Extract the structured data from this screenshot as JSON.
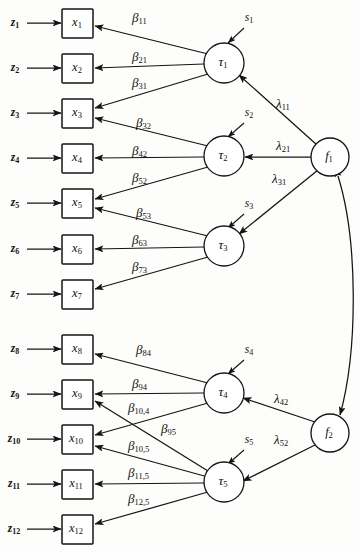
{
  "diagram": {
    "type": "structural-equation-path-diagram",
    "title": "",
    "canvas": {
      "width": 360,
      "height": 553
    },
    "colors": {
      "stroke": "#141414",
      "fill": "#ffffff",
      "background": "#fdfdfb"
    }
  },
  "observed_variables": [
    {
      "id": "x1",
      "label": "x",
      "sub": "1",
      "x": 77,
      "y": 23
    },
    {
      "id": "x2",
      "label": "x",
      "sub": "2",
      "x": 77,
      "y": 68
    },
    {
      "id": "x3",
      "label": "x",
      "sub": "3",
      "x": 77,
      "y": 113
    },
    {
      "id": "x4",
      "label": "x",
      "sub": "4",
      "x": 77,
      "y": 158
    },
    {
      "id": "x5",
      "label": "x",
      "sub": "5",
      "x": 77,
      "y": 203
    },
    {
      "id": "x6",
      "label": "x",
      "sub": "6",
      "x": 77,
      "y": 249
    },
    {
      "id": "x7",
      "label": "x",
      "sub": "7",
      "x": 77,
      "y": 294
    },
    {
      "id": "x8",
      "label": "x",
      "sub": "8",
      "x": 77,
      "y": 349
    },
    {
      "id": "x9",
      "label": "x",
      "sub": "9",
      "x": 77,
      "y": 394
    },
    {
      "id": "x10",
      "label": "x",
      "sub": "10",
      "x": 77,
      "y": 439
    },
    {
      "id": "x11",
      "label": "x",
      "sub": "11",
      "x": 77,
      "y": 484
    },
    {
      "id": "x12",
      "label": "x",
      "sub": "12",
      "x": 77,
      "y": 529
    }
  ],
  "error_variables": [
    {
      "id": "z1",
      "label": "z",
      "sub": "1",
      "x": 16,
      "y": 23
    },
    {
      "id": "z2",
      "label": "z",
      "sub": "2",
      "x": 16,
      "y": 68
    },
    {
      "id": "z3",
      "label": "z",
      "sub": "3",
      "x": 16,
      "y": 113
    },
    {
      "id": "z4",
      "label": "z",
      "sub": "4",
      "x": 16,
      "y": 158
    },
    {
      "id": "z5",
      "label": "z",
      "sub": "5",
      "x": 16,
      "y": 203
    },
    {
      "id": "z6",
      "label": "z",
      "sub": "6",
      "x": 16,
      "y": 249
    },
    {
      "id": "z7",
      "label": "z",
      "sub": "7",
      "x": 16,
      "y": 294
    },
    {
      "id": "z8",
      "label": "z",
      "sub": "8",
      "x": 16,
      "y": 349
    },
    {
      "id": "z9",
      "label": "z",
      "sub": "9",
      "x": 16,
      "y": 394
    },
    {
      "id": "z10",
      "label": "z",
      "sub": "10",
      "x": 16,
      "y": 439
    },
    {
      "id": "z11",
      "label": "z",
      "sub": "11",
      "x": 16,
      "y": 484
    },
    {
      "id": "z12",
      "label": "z",
      "sub": "12",
      "x": 16,
      "y": 529
    }
  ],
  "latent_tau": [
    {
      "id": "tau1",
      "label": "τ",
      "sub": "1",
      "x": 224,
      "y": 63,
      "r": 20
    },
    {
      "id": "tau2",
      "label": "τ",
      "sub": "2",
      "x": 224,
      "y": 156,
      "r": 20
    },
    {
      "id": "tau3",
      "label": "τ",
      "sub": "3",
      "x": 224,
      "y": 246,
      "r": 20
    },
    {
      "id": "tau4",
      "label": "τ",
      "sub": "4",
      "x": 224,
      "y": 393,
      "r": 20
    },
    {
      "id": "tau5",
      "label": "τ",
      "sub": "5",
      "x": 224,
      "y": 482,
      "r": 20
    }
  ],
  "latent_factors": [
    {
      "id": "f1",
      "label": "f",
      "sub": "1",
      "x": 330,
      "y": 157,
      "r": 19
    },
    {
      "id": "f2",
      "label": "f",
      "sub": "2",
      "x": 330,
      "y": 433,
      "r": 19
    }
  ],
  "disturbances": [
    {
      "id": "s1",
      "label": "s",
      "sub": "1",
      "x": 249,
      "y": 18
    },
    {
      "id": "s2",
      "label": "s",
      "sub": "2",
      "x": 249,
      "y": 113
    },
    {
      "id": "s3",
      "label": "s",
      "sub": "3",
      "x": 249,
      "y": 204
    },
    {
      "id": "s4",
      "label": "s",
      "sub": "4",
      "x": 249,
      "y": 350
    },
    {
      "id": "s5",
      "label": "s",
      "sub": "5",
      "x": 249,
      "y": 440
    }
  ],
  "beta_paths": [
    {
      "id": "b11",
      "label": "β",
      "sub": "11",
      "from": "tau1",
      "to": "x1",
      "lx": 132,
      "ly": 19
    },
    {
      "id": "b21",
      "label": "β",
      "sub": "21",
      "from": "tau1",
      "to": "x2",
      "lx": 132,
      "ly": 58
    },
    {
      "id": "b31",
      "label": "β",
      "sub": "31",
      "from": "tau1",
      "to": "x3",
      "lx": 132,
      "ly": 84
    },
    {
      "id": "b32",
      "label": "β",
      "sub": "32",
      "from": "tau2",
      "to": "x3",
      "lx": 136,
      "ly": 124
    },
    {
      "id": "b42",
      "label": "β",
      "sub": "42",
      "from": "tau2",
      "to": "x4",
      "lx": 132,
      "ly": 152
    },
    {
      "id": "b52",
      "label": "β",
      "sub": "52",
      "from": "tau2",
      "to": "x5",
      "lx": 132,
      "ly": 179
    },
    {
      "id": "b53",
      "label": "β",
      "sub": "53",
      "from": "tau3",
      "to": "x5",
      "lx": 136,
      "ly": 214
    },
    {
      "id": "b63",
      "label": "β",
      "sub": "63",
      "from": "tau3",
      "to": "x6",
      "lx": 132,
      "ly": 241
    },
    {
      "id": "b73",
      "label": "β",
      "sub": "73",
      "from": "tau3",
      "to": "x7",
      "lx": 132,
      "ly": 268
    },
    {
      "id": "b84",
      "label": "β",
      "sub": "84",
      "from": "tau4",
      "to": "x8",
      "lx": 136,
      "ly": 351
    },
    {
      "id": "b94",
      "label": "β",
      "sub": "94",
      "from": "tau4",
      "to": "x9",
      "lx": 132,
      "ly": 385
    },
    {
      "id": "b104",
      "label": "β",
      "sub": "10,4",
      "from": "tau4",
      "to": "x10",
      "lx": 128,
      "ly": 409
    },
    {
      "id": "b95",
      "label": "β",
      "sub": "95",
      "from": "tau5",
      "to": "x9",
      "lx": 161,
      "ly": 430
    },
    {
      "id": "b105",
      "label": "β",
      "sub": "10,5",
      "from": "tau5",
      "to": "x10",
      "lx": 128,
      "ly": 447
    },
    {
      "id": "b115",
      "label": "β",
      "sub": "11,5",
      "from": "tau5",
      "to": "x11",
      "lx": 128,
      "ly": 474
    },
    {
      "id": "b125",
      "label": "β",
      "sub": "12,5",
      "from": "tau5",
      "to": "x12",
      "lx": 128,
      "ly": 500
    }
  ],
  "lambda_paths": [
    {
      "id": "l11",
      "label": "λ",
      "sub": "11",
      "from": "f1",
      "to": "tau1",
      "lx": 276,
      "ly": 105
    },
    {
      "id": "l21",
      "label": "λ",
      "sub": "21",
      "from": "f1",
      "to": "tau2",
      "lx": 276,
      "ly": 147
    },
    {
      "id": "l31",
      "label": "λ",
      "sub": "31",
      "from": "f1",
      "to": "tau3",
      "lx": 272,
      "ly": 180
    },
    {
      "id": "l42",
      "label": "λ",
      "sub": "42",
      "from": "f2",
      "to": "tau4",
      "lx": 274,
      "ly": 400
    },
    {
      "id": "l52",
      "label": "λ",
      "sub": "52",
      "from": "f2",
      "to": "tau5",
      "lx": 274,
      "ly": 441
    }
  ],
  "factor_covariance": {
    "id": "f1-f2-covariance",
    "from": "f1",
    "to": "f2",
    "double_headed": true,
    "label": ""
  }
}
